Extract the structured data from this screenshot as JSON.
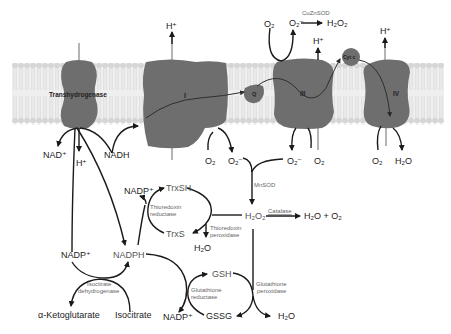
{
  "diagram": {
    "membrane": {
      "color": "#d9d9d9"
    },
    "proteins": [
      {
        "id": "transhydrogenase",
        "label": "Transhydrogenase"
      },
      {
        "id": "complex-I",
        "label": "I"
      },
      {
        "id": "coenzyme-q",
        "label": "Q"
      },
      {
        "id": "complex-III",
        "label": "III"
      },
      {
        "id": "cytochrome-c",
        "label": "Cyt c"
      },
      {
        "id": "complex-IV",
        "label": "IV"
      }
    ],
    "labels": {
      "h_plus": "H⁺",
      "nad_plus": "NAD⁺",
      "nadh": "NADH",
      "o2": "O₂",
      "superoxide": "O₂⁻",
      "h2o2": "H₂O₂",
      "h2o": "H₂O",
      "h2o_o2": "H₂O + O₂",
      "nadp_plus": "NADP⁺",
      "nadph": "NADPH",
      "trxsh": "TrxSH",
      "trxs": "TrxS",
      "gsh": "GSH",
      "gssg": "GSSG",
      "alpha_ketoglutarate": "α-Ketoglutarate",
      "isocitrate": "Isocitrate"
    },
    "enzymes": {
      "cuznsod": "CuZnSOD",
      "mnsod": "MnSOD",
      "catalase": "Catalase",
      "thioredoxin_reductase": [
        "Thioredoxin",
        "reductase"
      ],
      "thioredoxin_peroxidase": [
        "Thioredoxin",
        "peroxidase"
      ],
      "glutathione_reductase": [
        "Glutathione",
        "reductase"
      ],
      "glutathione_peroxidase": [
        "Glutathione",
        "peroxidase"
      ],
      "isocitrate_dehydrogenase": [
        "Isocitrate",
        "dehydrogenase"
      ]
    }
  }
}
